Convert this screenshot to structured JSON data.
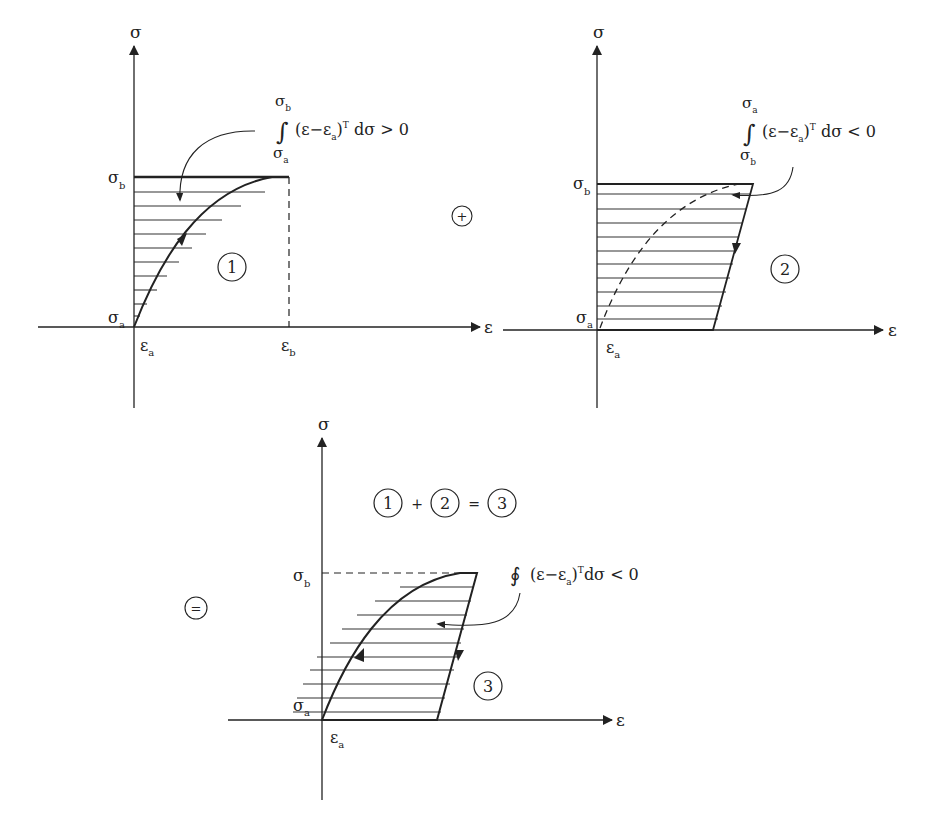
{
  "colors": {
    "ink": "#222222",
    "background": "#ffffff"
  },
  "symbols": {
    "sigma": "σ",
    "epsilon": "ε",
    "sub_a": "a",
    "sub_b": "b",
    "plus": "+",
    "equals": "="
  },
  "diagram1": {
    "number": "1",
    "y_axis_label": "σ",
    "x_axis_label": "ε",
    "sigma_b": "σ",
    "sigma_b_sub": "b",
    "sigma_a": "σ",
    "sigma_a_sub": "a",
    "eps_a": "ε",
    "eps_a_sub": "a",
    "eps_b": "ε",
    "eps_b_sub": "b",
    "integral": {
      "upper": "σ",
      "upper_sub": "b",
      "lower": "σ",
      "lower_sub": "a",
      "sign": "∫",
      "body_pre": "(ε−ε",
      "body_sub": "a",
      "body_post": ")",
      "sup": "T",
      "tail": " dσ > 0"
    }
  },
  "diagram2": {
    "number": "2",
    "y_axis_label": "σ",
    "x_axis_label": "ε",
    "sigma_b": "σ",
    "sigma_b_sub": "b",
    "sigma_a": "σ",
    "sigma_a_sub": "a",
    "eps_a": "ε",
    "eps_a_sub": "a",
    "integral": {
      "upper": "σ",
      "upper_sub": "a",
      "lower": "σ",
      "lower_sub": "b",
      "sign": "∫",
      "body_pre": "(ε−ε",
      "body_sub": "a",
      "body_post": ")",
      "sup": "T",
      "tail": " dσ < 0"
    }
  },
  "diagram3": {
    "number": "3",
    "y_axis_label": "σ",
    "x_axis_label": "ε",
    "sigma_b": "σ",
    "sigma_b_sub": "b",
    "sigma_a": "σ",
    "sigma_a_sub": "a",
    "eps_a": "ε",
    "eps_a_sub": "a",
    "equation": {
      "a": "1",
      "plus": "+",
      "b": "2",
      "eq": "=",
      "c": "3"
    },
    "integral": {
      "sign": "∮",
      "body_pre": "(ε−ε",
      "body_sub": "a",
      "body_post": ")",
      "sup": "T",
      "tail": "dσ < 0"
    }
  },
  "operators": {
    "plus": "+",
    "equals": "="
  }
}
